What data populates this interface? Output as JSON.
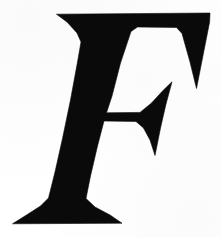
{
  "image": {
    "kind": "scanned-decorative-initial",
    "subject": "letter-F",
    "letter": "F",
    "alt_text": "Large black decorative serif capital letter F on a white background",
    "caption": "",
    "width_px": 221,
    "height_px": 237
  },
  "colors": {
    "background": "#ffffff",
    "ink": "#0a0a0a",
    "ink_edge": "#1a1a1a"
  },
  "glyph": {
    "name": "capital-f",
    "style": "slab-serif-italic-display",
    "fill": "#0a0a0a",
    "outline_path": "M 56.5 14.2 L 210.0 13.0 L 209.6 22.0 L 196.5 88.5 L 190.0 62.0 L 182.0 33.5 L 176.5 27.5 L 137.5 27.0 L 131.0 31.5 L 120.5 63.0 L 112.0 96.0 L 106.5 112.8 L 140.0 112.4 L 151.5 103.0 L 163.0 90.5 L 172.0 81.8 L 166.0 104.0 L 160.5 128.0 L 155.0 155.5 L 150.0 140.0 L 143.5 128.0 L 136.0 121.5 L 104.0 121.0 L 97.5 146.0 L 90.5 176.0 L 86.0 198.5 L 95.0 207.0 L 110.0 215.0 L 122.0 223.2 L 12.5 223.8 L 26.5 215.0 L 40.5 206.0 L 48.5 198.0 L 55.0 172.0 L 62.5 138.5 L 70.5 100.0 L 77.5 62.0 L 81.0 42.0 L 77.0 33.0 L 67.0 22.0 Z",
    "bar_notch_path": "",
    "bbox": {
      "x": 12,
      "y": 13,
      "width": 198,
      "height": 211
    },
    "anchors": {
      "top_bar_left_tip": [
        56,
        14
      ],
      "top_bar_right_end": [
        210,
        13
      ],
      "right_spur_tip": [
        196,
        88
      ],
      "crossbar_left": [
        106,
        113
      ],
      "crossbar_wedge_tip": [
        172,
        82
      ],
      "wedge_bottom_tip": [
        155,
        155
      ],
      "foot_left_tip": [
        12,
        224
      ],
      "foot_right_tip": [
        122,
        223
      ]
    }
  }
}
